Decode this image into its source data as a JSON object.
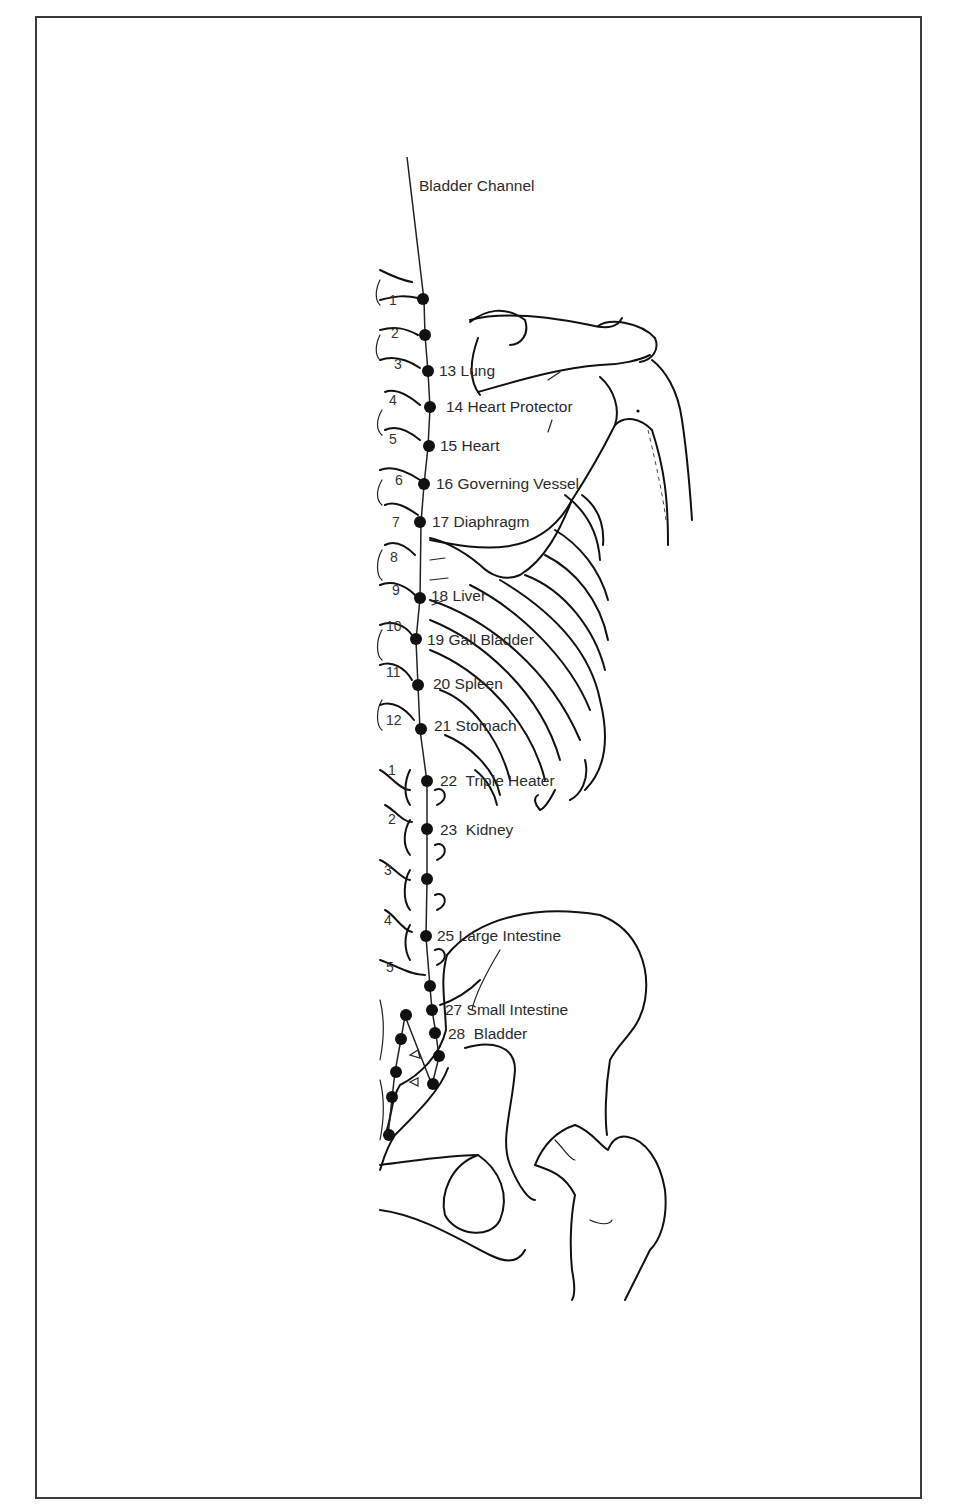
{
  "title": "Bladder Channel",
  "thoracic_vertebrae": [
    "1",
    "2",
    "3",
    "4",
    "5",
    "6",
    "7",
    "8",
    "9",
    "10",
    "11",
    "12"
  ],
  "lumbar_vertebrae": [
    "1",
    "2",
    "3",
    "4",
    "5"
  ],
  "points": [
    {
      "number": "13",
      "name": "Lung",
      "label": "13 Lung"
    },
    {
      "number": "14",
      "name": "Heart Protector",
      "label": "14 Heart Protector"
    },
    {
      "number": "15",
      "name": "Heart",
      "label": "15 Heart"
    },
    {
      "number": "16",
      "name": "Governing Vessel",
      "label": "16 Governing Vessel"
    },
    {
      "number": "17",
      "name": "Diaphragm",
      "label": "17 Diaphragm"
    },
    {
      "number": "18",
      "name": "Liver",
      "label": "18 Liver"
    },
    {
      "number": "19",
      "name": "Gall Bladder",
      "label": "19 Gall Bladder"
    },
    {
      "number": "20",
      "name": "Spleen",
      "label": "20 Spleen"
    },
    {
      "number": "21",
      "name": "Stomach",
      "label": "21 Stomach"
    },
    {
      "number": "22",
      "name": "Triple Heater",
      "label": "22  Triple Heater"
    },
    {
      "number": "23",
      "name": "Kidney",
      "label": "23  Kidney"
    },
    {
      "number": "25",
      "name": "Large Intestine",
      "label": "25 Large Intestine"
    },
    {
      "number": "27",
      "name": "Small Intestine",
      "label": "27 Small Intestine"
    },
    {
      "number": "28",
      "name": "Bladder",
      "label": "28  Bladder"
    }
  ],
  "unlabeled_points_count": 11
}
